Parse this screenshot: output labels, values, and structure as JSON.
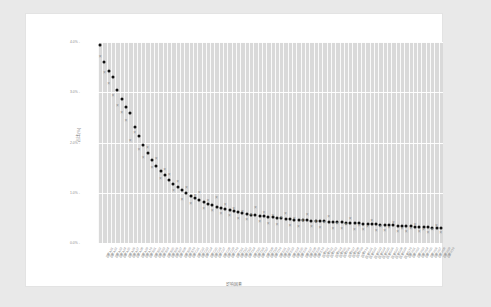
{
  "chart_data": {
    "type": "scatter",
    "title": "",
    "xlabel": "影响因素",
    "ylabel": "占比(%)",
    "ylim": [
      0,
      4.0
    ],
    "yticks": [
      4.0,
      3.0,
      2.0,
      1.0,
      0.0
    ],
    "ytick_labels": [
      "4.0% -",
      "3.0% -",
      "2.0% -",
      "1.0% -",
      "0.0% -"
    ],
    "grid": true,
    "legend_position": "none",
    "categories": [
      "因素A01",
      "因素A02",
      "因素A03",
      "因素A04",
      "因素A05",
      "因素A06",
      "因素A07",
      "因素A08",
      "因素A09",
      "因素A10",
      "因素B01",
      "因素B02",
      "因素B03",
      "因素B04",
      "因素B05",
      "因素B06",
      "因素B07",
      "因素B08",
      "因素B09",
      "因素B10",
      "因素C01",
      "因素C02",
      "因素C03",
      "因素C04",
      "因素C05",
      "因素C06",
      "因素C07",
      "因素C08",
      "因素C09",
      "因素C10",
      "因素D01",
      "因素D02",
      "因素D03",
      "因素D04",
      "因素D05",
      "因素D06",
      "因素D07",
      "因素D08",
      "因素D09",
      "因素D10",
      "因素E01",
      "因素E02",
      "因素E03",
      "因素E04",
      "因素E05",
      "因素E06",
      "因素E07",
      "因素E08",
      "因素E09",
      "因素E10",
      "因素F01",
      "因素F02",
      "因素F03",
      "因素F04",
      "因素F05",
      "因素F06",
      "因素F07",
      "因素F08",
      "因素F09",
      "因素F10",
      "因素G01",
      "因素G02",
      "因素G03",
      "因素G04",
      "因素G05",
      "因素G06",
      "因素G07",
      "因素G08",
      "因素G09",
      "因素G10",
      "因素H01",
      "因素H02",
      "因素H03",
      "因素H04",
      "因素H05",
      "因素H06",
      "因素H07",
      "因素H08",
      "因素H09",
      "因素H10"
    ],
    "series": [
      {
        "name": "主序列",
        "marker": "dot",
        "color": "#111111",
        "values": [
          3.95,
          3.6,
          3.42,
          3.3,
          3.05,
          2.86,
          2.7,
          2.58,
          2.3,
          2.12,
          1.96,
          1.8,
          1.66,
          1.54,
          1.44,
          1.35,
          1.26,
          1.18,
          1.11,
          1.05,
          0.99,
          0.94,
          0.89,
          0.85,
          0.81,
          0.78,
          0.75,
          0.72,
          0.69,
          0.67,
          0.65,
          0.63,
          0.61,
          0.59,
          0.58,
          0.56,
          0.55,
          0.54,
          0.53,
          0.52,
          0.51,
          0.5,
          0.49,
          0.48,
          0.47,
          0.465,
          0.46,
          0.455,
          0.45,
          0.445,
          0.44,
          0.435,
          0.43,
          0.425,
          0.42,
          0.415,
          0.41,
          0.405,
          0.4,
          0.395,
          0.39,
          0.385,
          0.38,
          0.375,
          0.37,
          0.365,
          0.36,
          0.355,
          0.35,
          0.345,
          0.34,
          0.335,
          0.33,
          0.325,
          0.32,
          0.315,
          0.31,
          0.305,
          0.3,
          0.295
        ]
      },
      {
        "name": "对比序列",
        "marker": "x",
        "color": "#8e8e8e",
        "values": [
          3.72,
          3.4,
          3.18,
          2.95,
          2.74,
          2.6,
          2.44,
          2.05,
          2.2,
          1.88,
          1.72,
          1.92,
          1.52,
          1.7,
          1.3,
          1.48,
          1.38,
          1.05,
          1.24,
          0.88,
          1.12,
          0.8,
          0.96,
          1.02,
          0.7,
          0.86,
          0.66,
          0.92,
          0.6,
          0.78,
          0.55,
          0.7,
          0.5,
          0.64,
          0.47,
          0.58,
          0.72,
          0.44,
          0.62,
          0.4,
          0.56,
          0.38,
          0.52,
          0.6,
          0.36,
          0.5,
          0.34,
          0.46,
          0.58,
          0.33,
          0.44,
          0.31,
          0.42,
          0.54,
          0.3,
          0.4,
          0.29,
          0.38,
          0.5,
          0.28,
          0.36,
          0.27,
          0.34,
          0.46,
          0.26,
          0.33,
          0.25,
          0.31,
          0.42,
          0.24,
          0.3,
          0.235,
          0.29,
          0.38,
          0.23,
          0.28,
          0.225,
          0.27,
          0.35,
          0.22
        ]
      }
    ]
  }
}
